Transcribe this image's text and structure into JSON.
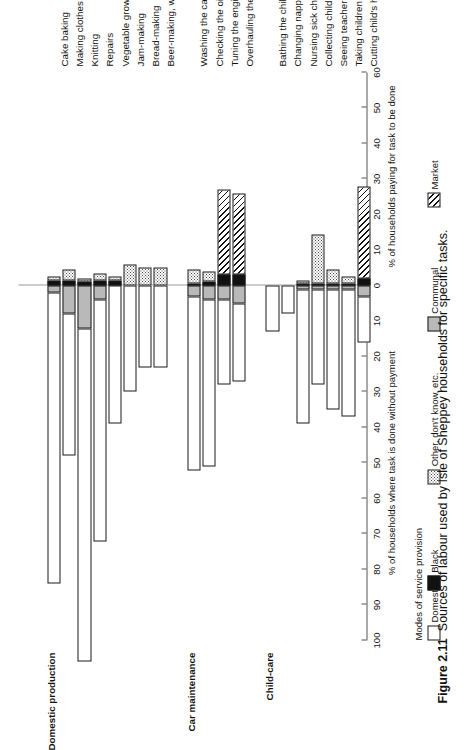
{
  "figure": {
    "number": "Figure 2.11",
    "caption": "Sources of labour used by Isle of Sheppey households for specific tasks."
  },
  "axis": {
    "positive_title": "% of households paying for task to be done",
    "negative_title": "% of households where task is done without payment",
    "ticks": [
      "60",
      "50",
      "40",
      "30",
      "20",
      "10",
      "0",
      "10",
      "20",
      "30",
      "40",
      "50",
      "60",
      "70",
      "80",
      "90",
      "100"
    ],
    "tick_values": [
      60,
      50,
      40,
      30,
      20,
      10,
      0,
      -10,
      -20,
      -30,
      -40,
      -50,
      -60,
      -70,
      -80,
      -90,
      -100
    ],
    "min": -100,
    "max": 60
  },
  "legend": {
    "title": "Modes of service provision",
    "items": [
      {
        "label": "Domestic",
        "key": "domestic",
        "color": "#ffffff"
      },
      {
        "label": "Black",
        "key": "black",
        "color": "#111111"
      },
      {
        "label": "Other, don't know, etc.",
        "key": "other",
        "color": "#dddddd"
      },
      {
        "label": "Communal",
        "key": "communal",
        "color": "#b9b9b9"
      },
      {
        "label": "Market",
        "key": "market",
        "color": "#ffffff"
      }
    ]
  },
  "groups": [
    {
      "name": "Domestic production",
      "label": "Domestic production"
    },
    {
      "name": "Car maintenance",
      "label": "Car maintenance"
    },
    {
      "name": "Child-care",
      "label": "Child-care"
    }
  ],
  "chart_data": {
    "type": "bar",
    "title": "Sources of labour used by Isle of Sheppey households for specific tasks.",
    "xlabel": "Task",
    "ylabel": "% of households",
    "ylim": [
      -100,
      60
    ],
    "orientation": "vertical-rotated",
    "stacked": true,
    "series": [
      {
        "name": "Domestic",
        "key": "domestic",
        "direction": "negative"
      },
      {
        "name": "Black",
        "key": "black",
        "direction": "positive"
      },
      {
        "name": "Other, don't know, etc.",
        "key": "other",
        "direction": "both"
      },
      {
        "name": "Communal",
        "key": "communal",
        "direction": "negative"
      },
      {
        "name": "Market",
        "key": "market",
        "direction": "positive"
      }
    ],
    "groups": [
      {
        "group": "Domestic production",
        "categories": [
          "Cake baking",
          "Making clothes",
          "Knitting",
          "Repairs",
          "Vegetable growing",
          "Jam-making",
          "Bread-making",
          "Beer-making, wine-making"
        ],
        "points": [
          {
            "label": "Cake baking",
            "domestic": 82,
            "communal": 2,
            "other_neg": 0,
            "black": 1.5,
            "other_pos": 1,
            "market": 0
          },
          {
            "label": "Making clothes",
            "domestic": 40,
            "communal": 8,
            "other_neg": 0,
            "black": 1.5,
            "other_pos": 3,
            "market": 0
          },
          {
            "label": "Knitting",
            "domestic": 94,
            "communal": 12,
            "other_neg": 0,
            "black": 1,
            "other_pos": 1,
            "market": 0
          },
          {
            "label": "Repairs",
            "domestic": 68,
            "communal": 4,
            "other_neg": 0,
            "black": 1.5,
            "other_pos": 2,
            "market": 0
          },
          {
            "label": "Vegetable growing",
            "domestic": 39,
            "communal": 0,
            "other_neg": 0,
            "black": 1.5,
            "other_pos": 1,
            "market": 0
          },
          {
            "label": "Jam-making",
            "domestic": 30,
            "communal": 0,
            "other_neg": 0,
            "black": 0,
            "other_pos": 6,
            "market": 0
          },
          {
            "label": "Bread-making",
            "domestic": 23,
            "communal": 0,
            "other_neg": 0,
            "black": 0,
            "other_pos": 5,
            "market": 0
          },
          {
            "label": "Beer-making, wine-making",
            "domestic": 23,
            "communal": 0,
            "other_neg": 0,
            "black": 0,
            "other_pos": 5,
            "market": 0
          }
        ]
      },
      {
        "group": "Car maintenance",
        "categories": [
          "Washing the car",
          "Checking the oil",
          "Tuning the engine",
          "Overhauling the brakes"
        ],
        "points": [
          {
            "label": "Washing the car",
            "domestic": 49,
            "communal": 3,
            "other_neg": 0,
            "black": 0.5,
            "other_pos": 4,
            "market": 0
          },
          {
            "label": "Checking the oil",
            "domestic": 47,
            "communal": 4,
            "other_neg": 0,
            "black": 1,
            "other_pos": 3,
            "market": 0
          },
          {
            "label": "Tuning the engine",
            "domestic": 24,
            "communal": 4,
            "other_neg": 0,
            "black": 3,
            "other_pos": 0,
            "market": 24
          },
          {
            "label": "Overhauling the brakes",
            "domestic": 22,
            "communal": 5,
            "other_neg": 0,
            "black": 3,
            "other_pos": 0,
            "market": 23
          }
        ]
      },
      {
        "group": "Child-care",
        "categories": [
          "Bathing the children",
          "Changing nappies",
          "Nursing sick children",
          "Collecting children from school",
          "Seeing teacher",
          "Taking children to doctor",
          "Cutting child's hair"
        ],
        "points": [
          {
            "label": "Bathing the children",
            "domestic": 13,
            "communal": 0,
            "other_neg": 0,
            "black": 0,
            "other_pos": 0,
            "market": 0
          },
          {
            "label": "Changing nappies",
            "domestic": 8,
            "communal": 0,
            "other_neg": 0,
            "black": 0,
            "other_pos": 0,
            "market": 0
          },
          {
            "label": "Nursing sick children",
            "domestic": 38,
            "communal": 1,
            "other_neg": 0,
            "black": 0.5,
            "other_pos": 1,
            "market": 0
          },
          {
            "label": "Collecting children from school",
            "domestic": 27,
            "communal": 1,
            "other_neg": 0,
            "black": 0.5,
            "other_pos": 14,
            "market": 0
          },
          {
            "label": "Seeing teacher",
            "domestic": 34,
            "communal": 1,
            "other_neg": 0,
            "black": 0.5,
            "other_pos": 4,
            "market": 0
          },
          {
            "label": "Taking children to doctor",
            "domestic": 36,
            "communal": 1,
            "other_neg": 0,
            "black": 0.5,
            "other_pos": 2,
            "market": 0
          },
          {
            "label": "Cutting child's hair",
            "domestic": 13,
            "communal": 3,
            "other_neg": 0,
            "black": 2,
            "other_pos": 0,
            "market": 26
          }
        ]
      }
    ]
  }
}
